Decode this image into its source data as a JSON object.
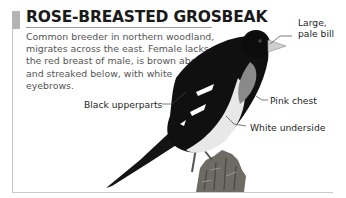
{
  "title": "ROSE-BREASTED GROSBEAK",
  "description": "Common breeder in northern woodland, migrates across the east. Female lacks the red breast of male, is brown above and streaked below, with white eyebrows.",
  "labels": {
    "bill_line1": "Large,",
    "bill_line2": "pale bill",
    "upperparts": "Black upperparts",
    "chest": "Pink chest",
    "underside": "White underside"
  },
  "colors": {
    "frame": "#c8c8c8",
    "marker": "#b4b4b4",
    "title": "#1a1a1a",
    "text": "#555555"
  },
  "image": {
    "subject": "rose-breasted grosbeak perched on stump",
    "style": "grayscale illustration"
  }
}
